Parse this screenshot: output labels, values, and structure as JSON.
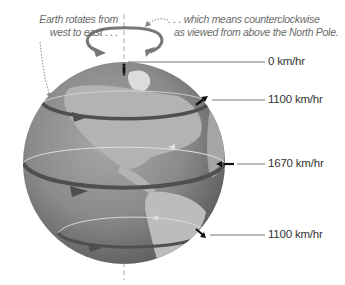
{
  "diagram": {
    "captions": {
      "left": [
        "Earth rotates from",
        "west to east . . ."
      ],
      "right": [
        ". . . which means counterclockwise",
        "as viewed from above the North Pole."
      ]
    },
    "speed_labels": [
      {
        "id": "pole",
        "label": "0 km/hr"
      },
      {
        "id": "mid-north",
        "label": "1100 km/hr"
      },
      {
        "id": "equator",
        "label": "1670 km/hr"
      },
      {
        "id": "mid-south",
        "label": "1100 km/hr"
      }
    ],
    "icons": {
      "rotation_arrow": "counterclockwise-rotation-arrow-icon",
      "person": "person-figure-icon",
      "globe": "earth-globe"
    },
    "colors": {
      "globe_base": "#8a8a8a",
      "land": "#b9b9b9",
      "band_dark": "#5a5a5a",
      "band_light": "#d9d9d9",
      "leader_line": "#555555",
      "caption_text": "#6b6b6b"
    }
  }
}
